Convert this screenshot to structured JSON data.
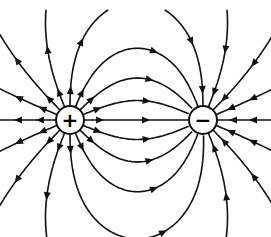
{
  "diagram": {
    "charges": [
      {
        "id": "positive",
        "symbol": "+",
        "x": 70,
        "y": 120,
        "r": 14
      },
      {
        "id": "negative",
        "symbol": "−",
        "x": 203,
        "y": 120,
        "r": 14
      }
    ],
    "line_color": "#111111",
    "background": "#ffffff"
  }
}
